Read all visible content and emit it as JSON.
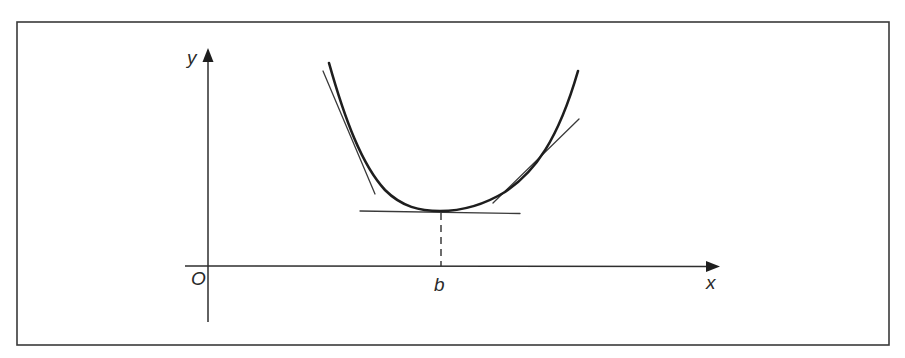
{
  "diagram": {
    "labels": {
      "y_axis": "y",
      "x_axis": "x",
      "origin": "O",
      "minimum_x": "b"
    },
    "elements": [
      {
        "type": "axis",
        "name": "x-axis",
        "arrow": true
      },
      {
        "type": "axis",
        "name": "y-axis",
        "arrow": true
      },
      {
        "type": "curve",
        "name": "U-shaped curve",
        "shape": "convex, minimum at x = b"
      },
      {
        "type": "tangent",
        "name": "left tangent",
        "slope": "negative"
      },
      {
        "type": "tangent",
        "name": "horizontal tangent at minimum",
        "slope": "zero"
      },
      {
        "type": "tangent",
        "name": "right tangent",
        "slope": "positive"
      },
      {
        "type": "dashed-line",
        "name": "projection from minimum to b on x-axis"
      }
    ],
    "colors": {
      "line": "#1e1e1e",
      "background": "#ffffff"
    }
  }
}
